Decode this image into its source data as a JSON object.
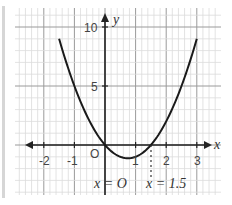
{
  "diagram": {
    "type": "function-graph",
    "function": "y = 2x^2 - 3x",
    "axes": {
      "x_label": "x",
      "y_label": "y",
      "origin_label": "O",
      "x_ticks": [
        "-2",
        "-1",
        "1",
        "2",
        "3"
      ],
      "y_ticks": [
        "5",
        "10"
      ]
    },
    "annotations": {
      "root_left": "x = O",
      "root_right": "x = 1.5"
    },
    "colors": {
      "curve": "#1a1a1a",
      "grid_minor": "#dcdcdc",
      "grid_major": "#9a9a9a",
      "axis": "#222222"
    }
  },
  "chart_data": {
    "type": "line",
    "title": "",
    "xlabel": "x",
    "ylabel": "y",
    "xlim": [
      -2.9,
      3.8
    ],
    "ylim": [
      -4.3,
      11.7
    ],
    "x_ticks": [
      -2,
      -1,
      1,
      2,
      3
    ],
    "y_ticks": [
      5,
      10
    ],
    "grid": true,
    "series": [
      {
        "name": "y = 2x^2 - 3x",
        "x": [
          -1.5,
          -1,
          -0.5,
          0,
          0.5,
          0.75,
          1,
          1.5,
          2,
          2.5,
          3
        ],
        "y": [
          9,
          5,
          2,
          0,
          -1,
          -1.125,
          -1,
          0,
          2,
          5,
          9
        ]
      }
    ],
    "annotations": [
      {
        "text": "x = 0",
        "x": 0
      },
      {
        "text": "x = 1.5",
        "x": 1.5
      }
    ]
  }
}
